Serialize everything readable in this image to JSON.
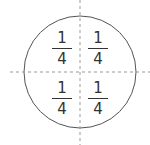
{
  "diagram": {
    "quarters": [
      {
        "position": "top-left",
        "numerator": "1",
        "denominator": "4"
      },
      {
        "position": "top-right",
        "numerator": "1",
        "denominator": "4"
      },
      {
        "position": "bottom-left",
        "numerator": "1",
        "denominator": "4"
      },
      {
        "position": "bottom-right",
        "numerator": "1",
        "denominator": "4"
      }
    ],
    "colors": {
      "stroke": "#555555",
      "dash": "#999999",
      "text": "#333333"
    }
  }
}
